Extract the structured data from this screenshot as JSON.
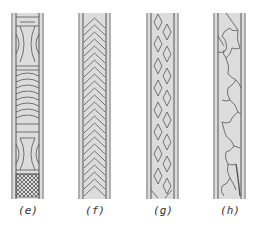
{
  "figure": {
    "panels": [
      {
        "id": "e",
        "label": "(e)",
        "pattern": "curved-panels-with-crosshatch",
        "x": 11
      },
      {
        "id": "f",
        "label": "(f)",
        "pattern": "chevron",
        "x": 78
      },
      {
        "id": "g",
        "label": "(g)",
        "pattern": "diamond-lattice",
        "x": 146
      },
      {
        "id": "h",
        "label": "(h)",
        "pattern": "irregular-meander",
        "x": 213
      }
    ],
    "colors": {
      "fill": "#dcdcdc",
      "line": "#555555",
      "background": "#ffffff"
    }
  }
}
